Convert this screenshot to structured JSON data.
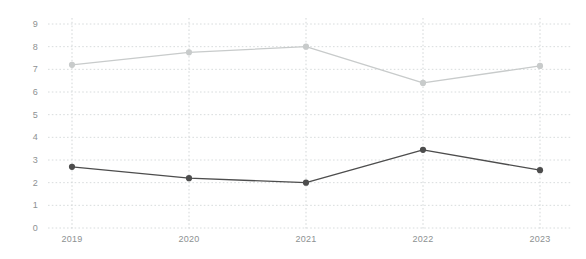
{
  "chart_data": {
    "type": "line",
    "title": "",
    "subtitle": "",
    "xlabel": "",
    "ylabel": "",
    "categories": [
      "2019",
      "2020",
      "2021",
      "2022",
      "2023"
    ],
    "ylim": [
      0,
      9
    ],
    "y_ticks": [
      0,
      1,
      2,
      3,
      4,
      5,
      6,
      7,
      8,
      9
    ],
    "y_tick_labels": [
      "0",
      "1",
      "2",
      "3",
      "4",
      "5",
      "6",
      "7",
      "8",
      "9"
    ],
    "grid": {
      "horizontal": true,
      "vertical": true,
      "style": "dotted"
    },
    "legend": {
      "visible": false,
      "position": "none",
      "entries": []
    },
    "series": [
      {
        "name": "series-light",
        "color": "#c8cbcb",
        "marker": "circle",
        "values": [
          7.2,
          7.75,
          8.0,
          6.4,
          7.15
        ]
      },
      {
        "name": "series-dark",
        "color": "#4d4d4d",
        "marker": "circle",
        "values": [
          2.7,
          2.2,
          2.0,
          3.45,
          2.55
        ]
      }
    ],
    "annotations": []
  },
  "colors": {
    "background": "#ffffff",
    "gridline": "#d8dcdd",
    "tick_label": "#8d9192",
    "series_light": "#c8cbcb",
    "series_dark": "#4d4d4d"
  },
  "axis": {
    "x_tick_labels": [
      "2019",
      "2020",
      "2021",
      "2022",
      "2023"
    ],
    "y_tick_labels": [
      "9",
      "8",
      "7",
      "6",
      "5",
      "4",
      "3",
      "2",
      "1",
      "0"
    ]
  }
}
